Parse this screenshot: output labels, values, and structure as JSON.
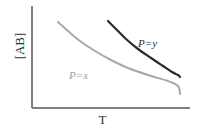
{
  "figure": {
    "background_color": "#ffffff",
    "width": 205,
    "height": 131
  },
  "axes": {
    "y_label": "[AB]",
    "x_label": "T",
    "axis_color": "#808080",
    "origin": {
      "x": 32,
      "y": 108
    },
    "y_axis_top": 6,
    "x_axis_right": 190
  },
  "labels": {
    "curve_y": "P=y",
    "curve_x": "P=x"
  },
  "chart_data": {
    "type": "line",
    "title": "",
    "xlabel": "T",
    "ylabel": "[AB]",
    "xlim": [
      0,
      1
    ],
    "ylim": [
      0,
      1
    ],
    "grid": false,
    "legend": "inline-annotations",
    "axis_ticks": {
      "x": [],
      "y": []
    },
    "series": [
      {
        "name": "P=x",
        "label": "P=x",
        "color": "#a8a8a8",
        "line_width": 2,
        "description": "Lower light-gray decaying curve; starts higher-left and decays toward the x-axis",
        "x": [
          0.175,
          0.22,
          0.28,
          0.35,
          0.43,
          0.52,
          0.62,
          0.73,
          0.85,
          0.94
        ],
        "y": [
          0.845,
          0.76,
          0.665,
          0.575,
          0.495,
          0.425,
          0.365,
          0.315,
          0.278,
          0.258
        ],
        "points_px": [
          [
            58,
            22
          ],
          [
            68,
            31
          ],
          [
            80,
            41
          ],
          [
            95,
            51
          ],
          [
            111,
            60
          ],
          [
            128,
            68
          ],
          [
            148,
            75
          ],
          [
            168,
            81
          ],
          [
            178,
            86
          ],
          [
            180,
            94
          ]
        ]
      },
      {
        "name": "P=y",
        "label": "P=y",
        "color": "#2b2b2b",
        "line_width": 2.2,
        "description": "Upper dark decaying curve; starts further right and remains above the gray curve",
        "x": [
          0.48,
          0.53,
          0.59,
          0.66,
          0.73,
          0.8,
          0.87,
          0.93,
          0.97
        ],
        "y": [
          0.855,
          0.775,
          0.69,
          0.605,
          0.53,
          0.47,
          0.425,
          0.395,
          0.382
        ],
        "points_px": [
          [
            108,
            21
          ],
          [
            116,
            29
          ],
          [
            126,
            39
          ],
          [
            138,
            49
          ],
          [
            151,
            58
          ],
          [
            163,
            66
          ],
          [
            172,
            72
          ],
          [
            178,
            75
          ],
          [
            180,
            77
          ]
        ]
      }
    ],
    "annotations": [
      {
        "text": "P=y",
        "x_px": 138,
        "y_px": 37,
        "color": "#2b2b2b",
        "style": "italic"
      },
      {
        "text": "P=x",
        "x_px": 69,
        "y_px": 69,
        "color": "#9d9d9d",
        "style": "italic"
      }
    ]
  }
}
